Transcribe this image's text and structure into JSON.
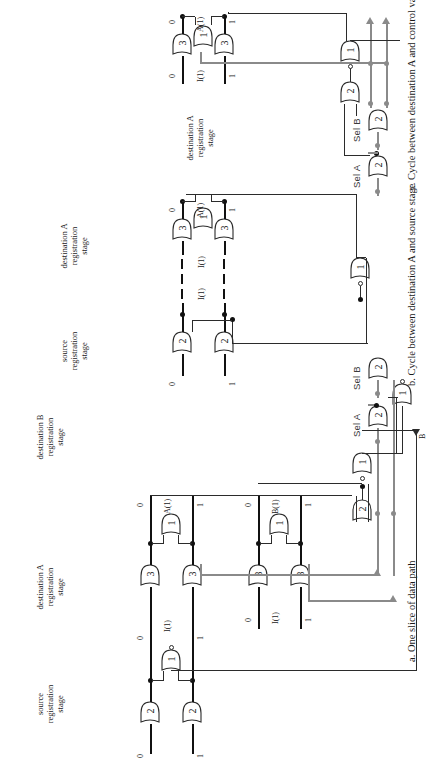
{
  "figure": {
    "orientation": "rotated-90-ccw",
    "captions": [
      {
        "id": "a",
        "text": "a.  One slice of data path"
      },
      {
        "id": "b",
        "text": "b. Cycle between destination A and source stage"
      },
      {
        "id": "c",
        "text": "c. Cycle between destination A and control variable"
      }
    ]
  },
  "panel_a": {
    "caption": "a.  One slice of data path",
    "control_labels": {
      "sel_a": "Sel A",
      "sel_b": "Sel B"
    },
    "output_label": "B",
    "stages": [
      {
        "name": "source-registration-stage",
        "lines": [
          "source",
          "registration",
          "stage"
        ]
      },
      {
        "name": "destination-a-registration-stage",
        "lines": [
          "destination A",
          "registration",
          "stage"
        ]
      },
      {
        "name": "destination-b-registration-stage",
        "lines": [
          "destination B",
          "registration",
          "stage"
        ]
      }
    ],
    "source_stage": {
      "in_rail_labels": [
        "0",
        "1"
      ],
      "out_rail_labels": [
        "0",
        "1"
      ],
      "bus_name": "I(1)",
      "gates": [
        {
          "threshold": "2"
        },
        {
          "threshold": "2"
        },
        {
          "threshold": "1"
        }
      ]
    },
    "dest_a_stage": {
      "in_rail_labels": [
        "0",
        "1"
      ],
      "in_bus_name": "I(1)",
      "out_rail_labels": [
        "0",
        "1"
      ],
      "out_bus_name": "A(1)",
      "gates": [
        {
          "threshold": "3"
        },
        {
          "threshold": "3"
        },
        {
          "threshold": "1"
        }
      ]
    },
    "dest_b_stage": {
      "in_rail_labels": [
        "0",
        "1"
      ],
      "in_bus_name": "I(1)",
      "out_rail_labels": [
        "0",
        "1"
      ],
      "out_bus_name": "B(1)",
      "gates": [
        {
          "threshold": "3"
        },
        {
          "threshold": "3"
        },
        {
          "threshold": "1"
        }
      ]
    },
    "control_gates": [
      {
        "threshold": "2",
        "name": "sel-a-gate"
      },
      {
        "threshold": "2",
        "name": "sel-b-gate"
      },
      {
        "threshold": "1",
        "name": "control-inverting-gate",
        "inverted": true
      }
    ],
    "ack_gates": [
      {
        "threshold": "2",
        "name": "ack-merge-gate"
      },
      {
        "threshold": "1",
        "name": "ack-inverting-gate",
        "inverted": true
      }
    ]
  },
  "panel_b": {
    "caption": "b. Cycle between destination A and source stage",
    "stages": [
      {
        "name": "source-registration-stage",
        "lines": [
          "source",
          "registration",
          "stage"
        ]
      },
      {
        "name": "destination-a-registration-stage",
        "lines": [
          "destination A",
          "registration",
          "stage"
        ]
      }
    ],
    "source_stage": {
      "rail_labels": [
        "0",
        "1"
      ],
      "gates": [
        {
          "threshold": "2"
        },
        {
          "threshold": "2"
        }
      ]
    },
    "dest_a_stage": {
      "in_rail_labels": [
        "0",
        "1"
      ],
      "in_bus_name": "I(1)",
      "mid_bus_name": "I(1)",
      "out_rail_labels": [
        "0",
        "1"
      ],
      "out_bus_name": "A(1)",
      "gates": [
        {
          "threshold": "3"
        },
        {
          "threshold": "3"
        },
        {
          "threshold": "1"
        }
      ]
    },
    "ack_gate": {
      "threshold": "1",
      "inverted": true
    }
  },
  "panel_c": {
    "caption": "c. Cycle between destination A and control variable",
    "control_labels": {
      "sel_a": "Sel A",
      "sel_b": "Sel B"
    },
    "stages": [
      {
        "name": "destination-a-registration-stage",
        "lines": [
          "destination A",
          "registration",
          "stage"
        ]
      }
    ],
    "dest_a_stage": {
      "in_rail_labels": [
        "0",
        "1"
      ],
      "in_bus_name": "I(1)",
      "out_rail_labels": [
        "0",
        "1"
      ],
      "out_bus_name": "A(1)",
      "gates": [
        {
          "threshold": "3"
        },
        {
          "threshold": "3"
        },
        {
          "threshold": "1"
        }
      ]
    },
    "control_gates": [
      {
        "threshold": "2",
        "name": "sel-a-gate"
      },
      {
        "threshold": "2",
        "name": "sel-b-gate"
      }
    ],
    "ack_gates": [
      {
        "threshold": "2",
        "name": "ack-merge-gate"
      },
      {
        "threshold": "1",
        "name": "ack-inverting-gate",
        "inverted": true
      }
    ]
  },
  "colors": {
    "wire": "#2b2b2b",
    "data_rail": "#111111",
    "control_wire": "#8a8a8a",
    "text": "#1a1a1a"
  }
}
